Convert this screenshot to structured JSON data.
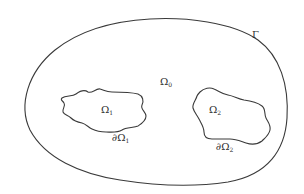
{
  "diagram": {
    "type": "domain-decomposition sketch",
    "colors": {
      "background": "#ffffff",
      "stroke": "#3a3a3a",
      "text": "#2e2e2e"
    },
    "outer_boundary": {
      "label": "Γ"
    },
    "outer_region": {
      "label": "Ω",
      "subscript": "0"
    },
    "subdomains": [
      {
        "label": "Ω",
        "subscript": "1",
        "boundary_label": "∂Ω",
        "boundary_subscript": "1"
      },
      {
        "label": "Ω",
        "subscript": "2",
        "boundary_label": "∂Ω",
        "boundary_subscript": "2"
      }
    ]
  }
}
